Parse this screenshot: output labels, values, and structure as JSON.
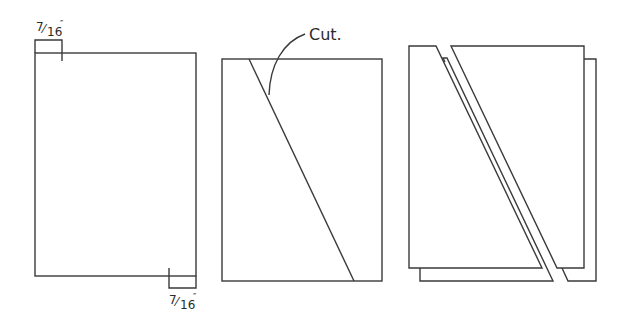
{
  "diagram": {
    "panels": [
      {
        "id": "panel-1",
        "description": "Rectangle with 7/16 inch offsets marked on top-left and bottom-right",
        "dimension_labels": [
          {
            "position": "top-left",
            "numerator": "7",
            "denominator": "16",
            "unit": "″",
            "text": "7/16″"
          },
          {
            "position": "bottom-right",
            "numerator": "7",
            "denominator": "16",
            "unit": "″",
            "text": "7/16″"
          }
        ]
      },
      {
        "id": "panel-2",
        "description": "Rectangle with diagonal cut line from top-left offset to bottom-right offset",
        "callout": {
          "text": "Cut."
        }
      },
      {
        "id": "panel-3",
        "description": "Two stacked sheets cut along diagonal, pieces separated"
      }
    ],
    "colors": {
      "line": "#3a3a3a",
      "background": "#ffffff"
    }
  }
}
